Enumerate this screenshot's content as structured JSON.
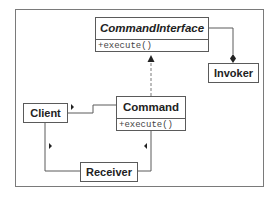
{
  "diagram": {
    "type": "UML class diagram",
    "classes": {
      "command_interface": {
        "name": "CommandInterface",
        "abstract": true,
        "methods": [
          "+execute()"
        ]
      },
      "command": {
        "name": "Command",
        "methods": [
          "+execute()"
        ]
      },
      "invoker": {
        "name": "Invoker"
      },
      "client": {
        "name": "Client"
      },
      "receiver": {
        "name": "Receiver"
      }
    },
    "relationships": [
      {
        "from": "Command",
        "to": "CommandInterface",
        "kind": "realization",
        "style": "dashed",
        "arrow": "filled-triangle"
      },
      {
        "from": "Invoker",
        "to": "CommandInterface",
        "kind": "aggregation",
        "arrow": "filled-diamond"
      },
      {
        "from": "Client",
        "to": "Command",
        "kind": "association",
        "arrow": "small-triangle"
      },
      {
        "from": "Client",
        "to": "Receiver",
        "kind": "association",
        "arrow": "small-triangle"
      },
      {
        "from": "Command",
        "to": "Receiver",
        "kind": "association",
        "arrow": "small-triangle"
      }
    ],
    "colors": {
      "line": "#5a5a5a",
      "frame": "#7a7a7a",
      "text": "#222222"
    }
  }
}
